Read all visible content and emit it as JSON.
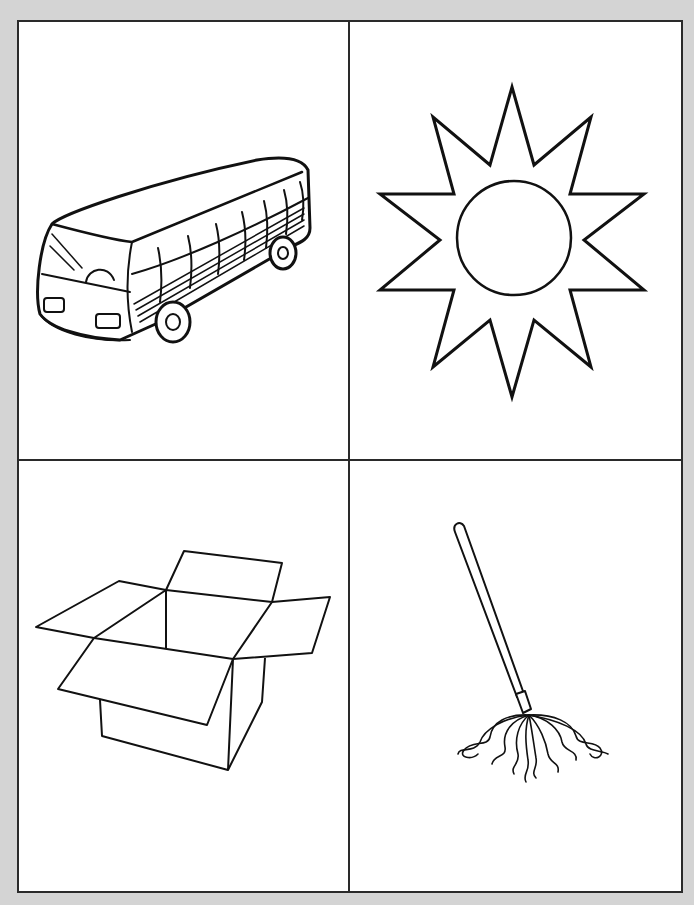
{
  "worksheet": {
    "layout": "2x2 picture grid",
    "cells": [
      {
        "position": "top-left",
        "label": "bus",
        "icon": "bus-icon"
      },
      {
        "position": "top-right",
        "label": "sun",
        "icon": "sun-icon"
      },
      {
        "position": "bottom-left",
        "label": "box",
        "icon": "box-icon"
      },
      {
        "position": "bottom-right",
        "label": "mop",
        "icon": "mop-icon"
      }
    ],
    "colors": {
      "background": "#d4d4d4",
      "sheet": "#ffffff",
      "line": "#1a1a1a"
    }
  }
}
